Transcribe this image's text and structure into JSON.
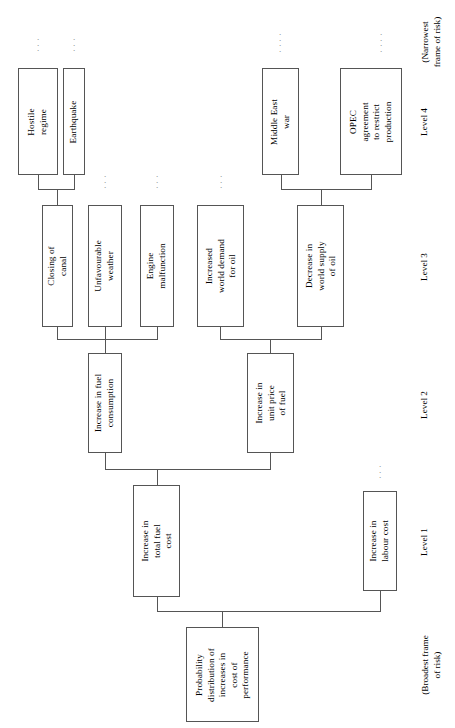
{
  "diagram": {
    "orientation": "rotated-90-ccw",
    "frame_labels": {
      "broadest": "(Broadest frame\nof risk)",
      "narrowest": "(Narrowest\nframe of risk)"
    },
    "levels": [
      {
        "id": "level1",
        "label": "Level 1"
      },
      {
        "id": "level2",
        "label": "Level 2"
      },
      {
        "id": "level3",
        "label": "Level 3"
      },
      {
        "id": "level4",
        "label": "Level 4"
      }
    ],
    "nodes": {
      "root": "Probability\ndistribution of\nincreases in\ncost of\nperformance",
      "l1_total_fuel_cost": "Increase in\ntotal fuel\ncost",
      "l1_labour_cost": "Increase in\nlabour cost",
      "l2_fuel_consumption": "Increase in fuel\nconsumption",
      "l2_unit_price_fuel": "Increase in\nunit price\nof fuel",
      "l3_closing_canal": "Closing of\ncanal",
      "l3_unfavourable_weather": "Unfavourable\nweather",
      "l3_engine_malfunction": "Engine\nmalfunction",
      "l3_world_demand_oil": "Increased\nworld demand\nfor oil",
      "l3_world_supply_oil": "Decrease in\nworld supply\nof oil",
      "l4_hostile_regime": "Hostile\nregime",
      "l4_earthquake": "Earthquake",
      "l4_middle_east_war": "Middle East\nwar",
      "l4_opec_agreement": "OPEC\nagreement\nto restrict\nproduction"
    },
    "ellipsis_glyph": "."
  }
}
